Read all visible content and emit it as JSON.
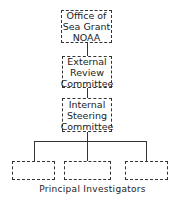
{
  "diagram": {
    "type": "org-chart",
    "nodes": [
      {
        "id": "office",
        "lines": [
          "Office of",
          "Sea Grant",
          "NOAA"
        ]
      },
      {
        "id": "external",
        "lines": [
          "External",
          "Review",
          "Committee"
        ]
      },
      {
        "id": "internal",
        "lines": [
          "Internal",
          "Steering",
          "Committee"
        ]
      },
      {
        "id": "pi1",
        "lines": []
      },
      {
        "id": "pi2",
        "lines": []
      },
      {
        "id": "pi3",
        "lines": []
      }
    ],
    "edges": [
      [
        "office",
        "external"
      ],
      [
        "external",
        "internal"
      ],
      [
        "internal",
        "pi1"
      ],
      [
        "internal",
        "pi2"
      ],
      [
        "internal",
        "pi3"
      ]
    ],
    "group_label": "Principal Investigators"
  }
}
